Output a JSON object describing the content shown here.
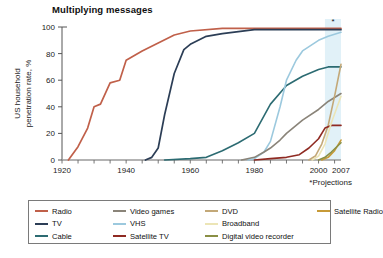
{
  "title": "Multiplying messages",
  "footnote": "*Projections",
  "projection_marker": "*",
  "axes": {
    "ylabel": "US household penetration rate, %",
    "yticks": [
      "0",
      "20",
      "40",
      "60",
      "80",
      "100"
    ],
    "xticks": [
      "1920",
      "1940",
      "1960",
      "1980",
      "2000",
      "2007"
    ]
  },
  "legend": {
    "items": [
      {
        "label": "Radio",
        "color": "#c0604a"
      },
      {
        "label": "Video games",
        "color": "#8a8479"
      },
      {
        "label": "DVD",
        "color": "#c3a878"
      },
      {
        "label": "Satellite Radio",
        "color": "#c79a37"
      },
      {
        "label": "TV",
        "color": "#2c3e56"
      },
      {
        "label": "VHS",
        "color": "#9cc9de"
      },
      {
        "label": "Broadband",
        "color": "#ece5b6"
      },
      {
        "label": "",
        "color": ""
      },
      {
        "label": "Cable",
        "color": "#2c6b72"
      },
      {
        "label": "Satellite TV",
        "color": "#8f2a22"
      },
      {
        "label": "Digital video recorder",
        "color": "#8a8f45"
      },
      {
        "label": "",
        "color": ""
      }
    ]
  },
  "chart_data": {
    "type": "line",
    "title": "Multiplying messages",
    "xlabel": "",
    "ylabel": "US household penetration rate, %",
    "xlim": [
      1920,
      2007
    ],
    "ylim": [
      0,
      100
    ],
    "grid": false,
    "legend_position": "bottom",
    "annotations": [
      "*Projections"
    ],
    "projection_band": [
      2002,
      2007
    ],
    "series": [
      {
        "name": "Radio",
        "color": "#c0604a",
        "x": [
          1922,
          1925,
          1928,
          1930,
          1932,
          1935,
          1938,
          1940,
          1945,
          1950,
          1955,
          1960,
          1970,
          1980,
          1990,
          2000,
          2007
        ],
        "values": [
          0,
          10,
          24,
          40,
          42,
          58,
          60,
          75,
          82,
          88,
          94,
          97,
          99,
          99,
          99,
          99,
          99
        ]
      },
      {
        "name": "TV",
        "color": "#2c3e56",
        "x": [
          1946,
          1948,
          1950,
          1952,
          1955,
          1958,
          1960,
          1965,
          1970,
          1980,
          1990,
          2000,
          2007
        ],
        "values": [
          0,
          2,
          9,
          34,
          65,
          83,
          87,
          93,
          95,
          98,
          98,
          98,
          98
        ]
      },
      {
        "name": "Cable",
        "color": "#2c6b72",
        "x": [
          1952,
          1960,
          1965,
          1970,
          1975,
          1980,
          1985,
          1990,
          1995,
          2000,
          2003,
          2007
        ],
        "values": [
          0,
          1,
          2,
          7,
          13,
          20,
          42,
          56,
          63,
          68,
          70,
          70
        ]
      },
      {
        "name": "VHS",
        "color": "#9cc9de",
        "x": [
          1978,
          1980,
          1983,
          1985,
          1988,
          1990,
          1993,
          1995,
          2000,
          2003,
          2007
        ],
        "values": [
          0,
          1,
          6,
          14,
          40,
          60,
          75,
          82,
          90,
          93,
          96
        ]
      },
      {
        "name": "Video games",
        "color": "#8a8479",
        "x": [
          1976,
          1980,
          1983,
          1985,
          1988,
          1990,
          1995,
          2000,
          2003,
          2007
        ],
        "values": [
          0,
          2,
          6,
          9,
          15,
          20,
          30,
          38,
          44,
          50
        ]
      },
      {
        "name": "DVD",
        "color": "#c3a878",
        "x": [
          1997,
          1999,
          2001,
          2003,
          2005,
          2007
        ],
        "values": [
          0,
          3,
          12,
          26,
          48,
          72
        ]
      },
      {
        "name": "Satellite TV",
        "color": "#8f2a22",
        "x": [
          1980,
          1985,
          1990,
          1994,
          1997,
          2000,
          2002,
          2004,
          2007
        ],
        "values": [
          0,
          1,
          2,
          4,
          9,
          16,
          24,
          26,
          26
        ]
      },
      {
        "name": "Broadband",
        "color": "#ece5b6",
        "x": [
          1998,
          2000,
          2002,
          2004,
          2007
        ],
        "values": [
          0,
          3,
          12,
          28,
          48
        ]
      },
      {
        "name": "Satellite Radio",
        "color": "#c79a37",
        "x": [
          2001,
          2003,
          2005,
          2007
        ],
        "values": [
          0,
          2,
          7,
          15
        ]
      },
      {
        "name": "Digital video recorder",
        "color": "#8a8f45",
        "x": [
          2000,
          2002,
          2004,
          2007
        ],
        "values": [
          0,
          2,
          6,
          13
        ]
      }
    ]
  }
}
